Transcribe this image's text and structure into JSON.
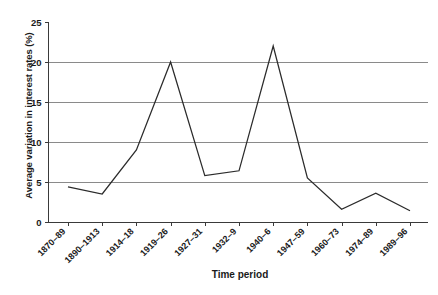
{
  "chart_data": {
    "type": "line",
    "title": "",
    "xlabel": "Time period",
    "ylabel": "Average variation in interest rates (%)",
    "categories": [
      "1870–89",
      "1890–1913",
      "1914–18",
      "1919–26",
      "1927–31",
      "1932–9",
      "1940–6",
      "1947–59",
      "1960–73",
      "1974–89",
      "1989–96"
    ],
    "values": [
      4.4,
      3.5,
      9.0,
      20.0,
      5.8,
      6.4,
      22.0,
      5.5,
      1.6,
      3.6,
      1.4
    ],
    "series": [
      {
        "name": "Average variation in interest rates",
        "values": [
          4.4,
          3.5,
          9.0,
          20.0,
          5.8,
          6.4,
          22.0,
          5.5,
          1.6,
          3.6,
          1.4
        ]
      }
    ],
    "ylim": [
      0,
      25
    ],
    "yticks": [
      0,
      5,
      10,
      15,
      20,
      25
    ],
    "ytick_labels": [
      "0",
      "5",
      "10",
      "15",
      "20",
      "25"
    ],
    "grid": "horizontal",
    "legend": "none",
    "line_color": "#2b2b2b",
    "grid_color": "#8a8a8a",
    "axis_color": "#3a3a3a",
    "background": "#ffffff"
  }
}
